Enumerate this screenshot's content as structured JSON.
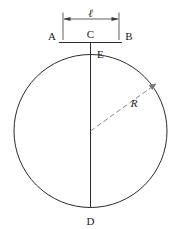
{
  "figure": {
    "background_color": "#ffffff",
    "line_color": "#2b2b2b",
    "dashed_color": "#777777",
    "width": 182,
    "height": 229
  },
  "labels": {
    "chord_length": "ℓ",
    "point_a": "A",
    "point_b": "B",
    "point_c": "C",
    "point_d": "D",
    "point_e": "E",
    "radius": "R"
  },
  "chart_data": {
    "type": "diagram",
    "shapes": [
      {
        "name": "circle",
        "kind": "circle",
        "cx": 90.5,
        "cy": 131.0,
        "r": 76.5
      },
      {
        "name": "chord-ab",
        "kind": "line",
        "x1": 59.0,
        "y1": 42.5,
        "x2": 122.0,
        "y2": 42.5
      },
      {
        "name": "diameter-cd",
        "kind": "line",
        "x1": 90.5,
        "y1": 42.5,
        "x2": 90.5,
        "y2": 207.5
      },
      {
        "name": "radius-dashed",
        "kind": "line",
        "x1": 90.5,
        "y1": 131.0,
        "x2": 155.0,
        "y2": 85.0
      },
      {
        "name": "dimension-line",
        "kind": "line",
        "x1": 63.0,
        "y1": 19.0,
        "x2": 119.0,
        "y2": 19.0
      },
      {
        "name": "extension-left",
        "kind": "line",
        "x1": 63.0,
        "y1": 13.0,
        "x2": 63.0,
        "y2": 40.0
      },
      {
        "name": "extension-right",
        "kind": "line",
        "x1": 119.0,
        "y1": 13.0,
        "x2": 119.0,
        "y2": 40.0
      }
    ],
    "points": [
      {
        "id": "A",
        "label": "A",
        "x": 59.0,
        "y": 42.5,
        "label_x": 55.0,
        "label_y": 36.0
      },
      {
        "id": "B",
        "label": "B",
        "x": 122.0,
        "y": 42.5,
        "label_x": 124.0,
        "label_y": 36.0
      },
      {
        "id": "C",
        "label": "C",
        "x": 90.5,
        "y": 42.5,
        "label_x": 90.5,
        "label_y": 35.0
      },
      {
        "id": "E",
        "label": "E",
        "x": 90.5,
        "y": 54.5,
        "label_x": 96.0,
        "label_y": 54.0
      },
      {
        "id": "D",
        "label": "D",
        "x": 90.5,
        "y": 207.5,
        "label_x": 90.5,
        "label_y": 222.0
      }
    ],
    "annotations": [
      {
        "id": "ell",
        "label": "ℓ",
        "x": 90.5,
        "y": 13.5,
        "describes": "chord length A to B"
      },
      {
        "id": "R",
        "label": "R",
        "x": 134.0,
        "y": 104.0,
        "describes": "radius of circle"
      }
    ]
  }
}
